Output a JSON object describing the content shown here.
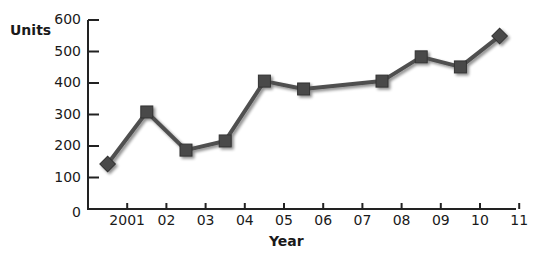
{
  "chart_data": {
    "type": "line",
    "title": "",
    "xlabel": "Year",
    "ylabel": "Units",
    "ylim": [
      0,
      600
    ],
    "yticks": [
      0,
      100,
      200,
      300,
      400,
      500,
      600
    ],
    "xtick_labels": [
      "2001",
      "02",
      "03",
      "04",
      "05",
      "06",
      "07",
      "08",
      "09",
      "10",
      "11"
    ],
    "grid": false,
    "legend": null,
    "series": [
      {
        "name": "Units",
        "points": [
          {
            "x": 2000.5,
            "y": 143
          },
          {
            "x": 2001.5,
            "y": 308
          },
          {
            "x": 2002.5,
            "y": 187
          },
          {
            "x": 2003.5,
            "y": 216
          },
          {
            "x": 2004.5,
            "y": 406
          },
          {
            "x": 2005.5,
            "y": 381
          },
          {
            "x": 2007.5,
            "y": 406
          },
          {
            "x": 2008.5,
            "y": 483
          },
          {
            "x": 2009.5,
            "y": 451
          },
          {
            "x": 2010.5,
            "y": 549
          }
        ],
        "color": "#4a4a4a",
        "marker_ends": "diamond",
        "marker_middle": "square"
      }
    ]
  }
}
